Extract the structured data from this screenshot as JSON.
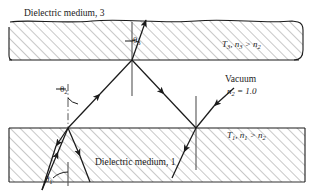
{
  "figure": {
    "type": "optics-ray-diagram",
    "background_color": "#ffffff",
    "line_color": "#1a1a1a",
    "hatch_color": "#9a9a9a"
  },
  "labels": {
    "medium_top": "Dielectric medium, 3",
    "medium_bottom": "Dielectric medium, 1",
    "vacuum": "Vacuum",
    "angle_theta3": "θ",
    "angle_theta3_sub": "3",
    "angle_theta2": "θ",
    "angle_theta2_sub": "2",
    "angle_theta1": "θ",
    "angle_theta1_sub": "1"
  },
  "annotations": {
    "top_region": {
      "transmittance": "T",
      "transmittance_sub": "3",
      "separator": ", ",
      "index": "n",
      "index_sub": "3",
      "relation": " > ",
      "index2": "n",
      "index2_sub": "2"
    },
    "bottom_region": {
      "transmittance": "T",
      "transmittance_sub": "1",
      "separator": ", ",
      "index": "n",
      "index_sub": "1",
      "relation": " > ",
      "index2": "n",
      "index2_sub": "2"
    },
    "vacuum_index": {
      "symbol": "n",
      "symbol_sub": "2",
      "equals": " = 1.0"
    }
  },
  "geometry": {
    "top_slab": {
      "y_top": 22,
      "y_bottom": 60,
      "x_left": 8,
      "x_right": 303
    },
    "bottom_slab": {
      "y_top": 128,
      "y_bottom": 185,
      "x_left": 8,
      "x_right": 305
    },
    "vertex_top": {
      "x": 132,
      "y": 60
    },
    "vertex_bottom_left": {
      "x": 68,
      "y": 128
    },
    "vertex_bottom_right": {
      "x": 196,
      "y": 128
    }
  }
}
